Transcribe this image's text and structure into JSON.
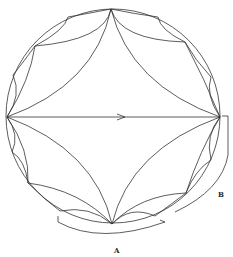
{
  "diagram": {
    "type": "hyperbolic-tessellation-disk",
    "labels": {
      "a": "A",
      "b": "B"
    },
    "stroke_color": "#333333",
    "background": "#ffffff"
  }
}
